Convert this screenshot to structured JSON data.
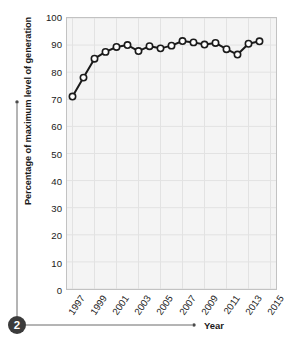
{
  "chart_data": {
    "type": "line",
    "title": "",
    "xlabel": "Year",
    "ylabel": "Percentage of maximum level of generation",
    "xlim": [
      1996.5,
      2015.5
    ],
    "ylim": [
      0,
      100
    ],
    "grid": true,
    "legend_position": "none",
    "x": [
      1997,
      1998,
      1999,
      2000,
      2001,
      2002,
      2003,
      2004,
      2005,
      2006,
      2007,
      2008,
      2009,
      2010,
      2011,
      2012,
      2013,
      2014
    ],
    "values": [
      71,
      78,
      85,
      87.5,
      89.3,
      90,
      87.8,
      89.6,
      88.8,
      89.8,
      91.5,
      91,
      90.2,
      90.8,
      88.5,
      86.5,
      90.5,
      91.4
    ],
    "series": [
      {
        "name": "Percentage of maximum level of generation",
        "values": [
          71,
          78,
          85,
          87.5,
          89.3,
          90,
          87.8,
          89.6,
          88.8,
          89.8,
          91.5,
          91,
          90.2,
          90.8,
          88.5,
          86.5,
          90.5,
          91.4
        ]
      }
    ],
    "y_ticks": [
      0,
      10,
      20,
      30,
      40,
      50,
      60,
      70,
      80,
      90,
      100
    ],
    "y_tick_labels": [
      "0",
      "10",
      "20",
      "30",
      "40",
      "50",
      "60",
      "70",
      "80",
      "90",
      "100"
    ],
    "x_ticks": [
      1997,
      1999,
      2001,
      2003,
      2005,
      2007,
      2009,
      2011,
      2013,
      2015
    ],
    "x_tick_labels": [
      "1997",
      "1999",
      "2001",
      "2003",
      "2005",
      "2007",
      "2009",
      "2011",
      "2013",
      "2015"
    ],
    "marker": "open-circle",
    "line_color": "#1a1a1a",
    "marker_face_color": "#ffffff",
    "marker_edge_color": "#1a1a1a",
    "plot_background": "#f4f4f4",
    "grid_color": "#e2e2e2"
  },
  "annotation": {
    "badge_label": "2",
    "badge_color": "#3b3b3b",
    "points_to": "Year"
  }
}
